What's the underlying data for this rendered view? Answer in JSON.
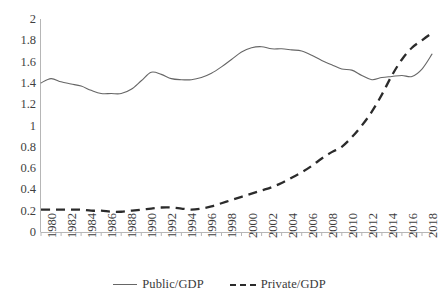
{
  "chart_data": {
    "type": "line",
    "title": "",
    "xlabel": "",
    "ylabel": "",
    "xlim": [
      1980,
      2019
    ],
    "ylim": [
      0,
      2
    ],
    "ytick_labels": [
      "0",
      "0.2",
      "0.4",
      "0.6",
      "0.8",
      "1",
      "1.2",
      "1.4",
      "1.6",
      "1.8",
      "2"
    ],
    "ytick_values": [
      0,
      0.2,
      0.4,
      0.6,
      0.8,
      1,
      1.2,
      1.4,
      1.6,
      1.8,
      2
    ],
    "xtick_labels": [
      "1980",
      "1982",
      "1984",
      "1986",
      "1988",
      "1990",
      "1992",
      "1994",
      "1996",
      "1998",
      "2000",
      "2002",
      "2004",
      "2006",
      "2008",
      "2010",
      "2012",
      "2014",
      "2016",
      "2018"
    ],
    "x": [
      1980,
      1981,
      1982,
      1983,
      1984,
      1985,
      1986,
      1987,
      1988,
      1989,
      1990,
      1991,
      1992,
      1993,
      1994,
      1995,
      1996,
      1997,
      1998,
      1999,
      2000,
      2001,
      2002,
      2003,
      2004,
      2005,
      2006,
      2007,
      2008,
      2009,
      2010,
      2011,
      2012,
      2013,
      2014,
      2015,
      2016,
      2017,
      2018,
      2019
    ],
    "grid": false,
    "legend_position": "bottom",
    "series": [
      {
        "name": "Public/GDP",
        "style": "solid",
        "color": "#666666",
        "values": [
          1.4,
          1.44,
          1.41,
          1.39,
          1.37,
          1.33,
          1.3,
          1.3,
          1.3,
          1.34,
          1.42,
          1.5,
          1.48,
          1.44,
          1.43,
          1.43,
          1.45,
          1.49,
          1.55,
          1.62,
          1.69,
          1.73,
          1.74,
          1.72,
          1.72,
          1.71,
          1.7,
          1.66,
          1.61,
          1.57,
          1.53,
          1.52,
          1.47,
          1.43,
          1.45,
          1.46,
          1.47,
          1.46,
          1.53,
          1.67
        ]
      },
      {
        "name": "Private/GDP",
        "style": "dashed",
        "color": "#2b2b2b",
        "values": [
          0.21,
          0.21,
          0.21,
          0.21,
          0.21,
          0.2,
          0.2,
          0.19,
          0.19,
          0.2,
          0.21,
          0.22,
          0.23,
          0.23,
          0.22,
          0.21,
          0.22,
          0.24,
          0.27,
          0.3,
          0.33,
          0.36,
          0.39,
          0.42,
          0.46,
          0.51,
          0.56,
          0.62,
          0.69,
          0.75,
          0.8,
          0.89,
          1.0,
          1.13,
          1.29,
          1.47,
          1.62,
          1.73,
          1.8,
          1.87
        ]
      }
    ]
  },
  "legend": {
    "items": [
      {
        "label": "Public/GDP",
        "style": "solid"
      },
      {
        "label": "Private/GDP",
        "style": "dashed"
      }
    ]
  }
}
